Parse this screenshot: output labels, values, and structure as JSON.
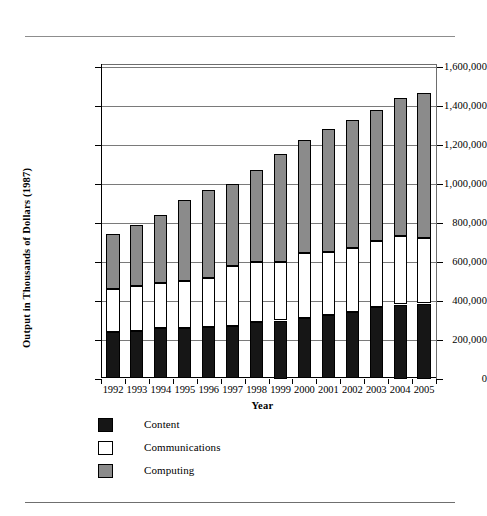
{
  "chart_data": {
    "type": "bar",
    "subtype": "stacked-vertical",
    "title": "",
    "xlabel": "Year",
    "ylabel": "Output in Thousands of Dollars (1987)",
    "ylim": [
      0,
      1600000
    ],
    "ytick_labels": [
      "0",
      "200,000",
      "400,000",
      "600,000",
      "800,000",
      "1,000,000",
      "1,200,000",
      "1,400,000",
      "1,600,000"
    ],
    "ytick_values": [
      0,
      200000,
      400000,
      600000,
      800000,
      1000000,
      1200000,
      1400000,
      1600000
    ],
    "grid": true,
    "legend_position": "below-left",
    "categories": [
      "1992",
      "1993",
      "1994",
      "1995",
      "1996",
      "1997",
      "1998",
      "1999",
      "2000",
      "2001",
      "2002",
      "2003",
      "2004",
      "2005"
    ],
    "series": [
      {
        "name": "Content",
        "color": "#161616",
        "values": [
          238000,
          245000,
          258000,
          260000,
          265000,
          268000,
          288000,
          298000,
          310000,
          328000,
          342000,
          365000,
          380000,
          385000
        ]
      },
      {
        "name": "Communications",
        "color": "#ffffff",
        "values": [
          222000,
          228000,
          235000,
          240000,
          252000,
          308000,
          312000,
          302000,
          335000,
          322000,
          330000,
          340000,
          350000,
          335000
        ]
      },
      {
        "name": "Computing",
        "color": "#8b8b8b",
        "values": [
          285000,
          317000,
          347000,
          415000,
          453000,
          424000,
          470000,
          555000,
          580000,
          632000,
          655000,
          675000,
          712000,
          745000
        ]
      }
    ],
    "totals": [
      745000,
      790000,
      840000,
      915000,
      970000,
      1000000,
      1070000,
      1155000,
      1225000,
      1282000,
      1327000,
      1380000,
      1442000,
      1465000
    ],
    "legend": [
      {
        "label": "Content",
        "color": "#161616"
      },
      {
        "label": "Communications",
        "color": "#ffffff"
      },
      {
        "label": "Computing",
        "color": "#8b8b8b"
      }
    ]
  }
}
